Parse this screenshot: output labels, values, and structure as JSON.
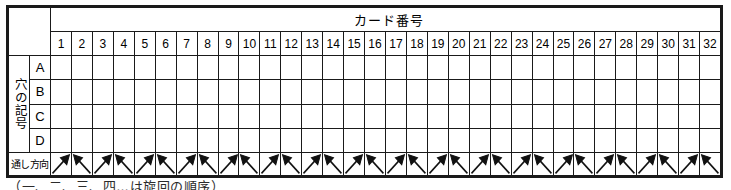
{
  "table": {
    "corner_label": "",
    "card_number_header": "カード番号",
    "side_label": "穴の記号",
    "direction_label": "通し方向",
    "column_numbers": [
      "1",
      "2",
      "3",
      "4",
      "5",
      "6",
      "7",
      "8",
      "9",
      "10",
      "11",
      "12",
      "13",
      "14",
      "15",
      "16",
      "17",
      "18",
      "19",
      "20",
      "21",
      "22",
      "23",
      "24",
      "25",
      "26",
      "27",
      "28",
      "29",
      "30",
      "31",
      "32"
    ],
    "row_letters": [
      "A",
      "B",
      "C",
      "D"
    ],
    "row_fill": {
      "A": "dark",
      "B": "dark",
      "C": "light",
      "D": "light"
    },
    "arrow_directions": [
      "up-right",
      "up-left",
      "up-right",
      "up-left",
      "up-right",
      "up-left",
      "up-right",
      "up-left",
      "up-right",
      "up-left",
      "up-right",
      "up-left",
      "up-right",
      "up-left",
      "up-right",
      "up-left",
      "up-right",
      "up-left",
      "up-right",
      "up-left",
      "up-right",
      "up-left",
      "up-right",
      "up-left",
      "up-right",
      "up-left",
      "up-right",
      "up-left",
      "up-right",
      "up-left",
      "up-right",
      "up-left"
    ]
  },
  "caption": {
    "text": "（一、二、三、四…は旋回の順序）"
  },
  "colors": {
    "cell_dark": "#75751f",
    "cell_light": "#e9e930",
    "border": "#1a1a1a",
    "background": "#ffffff",
    "text": "#000000"
  }
}
